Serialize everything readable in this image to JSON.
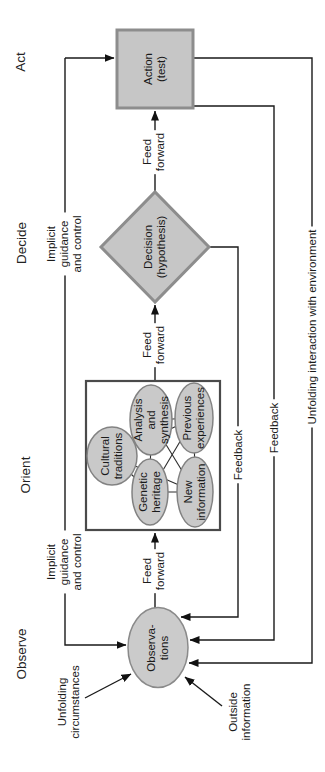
{
  "figure_type": "ooda-loop-diagram",
  "orientation": "rotated-90-ccw",
  "colors": {
    "background": "#ffffff",
    "node_fill": "#c6c6c6",
    "node_border": "#8d8d8d",
    "ellipse_fill": "#c9c9c9",
    "orient_box_border": "#4a4a4a",
    "line": "#1a1a1a",
    "text": "#1b1b1b"
  },
  "phases": {
    "observe": "Observe",
    "orient": "Orient",
    "decide": "Decide",
    "act": "Act"
  },
  "nodes": {
    "observations": "Observa-\ntions",
    "decision": "Decision\n(hypothesis)",
    "action": "Action\n(test)",
    "orient_ellipses": {
      "cultural": "Cultural\ntraditions",
      "genetic": "Genetic\nheritage",
      "analysis": "Analysis\nand\nsynthesis",
      "new_information": "New\ninformation",
      "previous": "Previous\nexperiences"
    }
  },
  "annotations": {
    "feed_forward_1": "Feed\nforward",
    "feed_forward_2": "Feed\nforward",
    "feed_forward_3": "Feed\nforward",
    "implicit_guidance_observe": "Implicit\nguidance\nand control",
    "implicit_guidance_decide": "Implicit\nguidance\nand control",
    "feedback_decision": "Feedback",
    "feedback_action": "Feedback",
    "environment": "Unfolding interaction with environment",
    "unfolding_circumstances": "Unfolding\ncircumstances",
    "outside_information": "Outside\ninformation"
  }
}
